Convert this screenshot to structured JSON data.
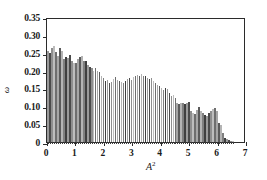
{
  "chart_data": {
    "type": "bar",
    "title": "",
    "subtitle": "",
    "xlabel": "A²",
    "xlabel_base": "A",
    "xlabel_exp": "2",
    "ylabel": "ω",
    "xlim": [
      0,
      7
    ],
    "ylim": [
      0,
      0.35
    ],
    "grid": false,
    "legend": null,
    "bin_width": 0.07,
    "x_ticks": [
      0,
      1,
      2,
      3,
      4,
      5,
      6,
      7
    ],
    "x_ticklabels": [
      "0",
      "1",
      "2",
      "3",
      "4",
      "5",
      "6",
      "7"
    ],
    "y_ticks": [
      0,
      0.05,
      0.1,
      0.15,
      0.2,
      0.25,
      0.3,
      0.35
    ],
    "y_ticklabels": [
      "0",
      "0.05",
      "0.10",
      "0.15",
      "0.20",
      "0.25",
      "0.30",
      "0.35"
    ],
    "x": [
      0.04,
      0.11,
      0.18,
      0.25,
      0.32,
      0.39,
      0.46,
      0.53,
      0.6,
      0.67,
      0.74,
      0.81,
      0.88,
      0.95,
      1.02,
      1.09,
      1.16,
      1.23,
      1.3,
      1.37,
      1.44,
      1.51,
      1.58,
      1.65,
      1.72,
      1.79,
      1.86,
      1.93,
      2.0,
      2.07,
      2.14,
      2.21,
      2.28,
      2.35,
      2.42,
      2.49,
      2.56,
      2.63,
      2.7,
      2.77,
      2.84,
      2.91,
      2.98,
      3.05,
      3.12,
      3.19,
      3.26,
      3.33,
      3.4,
      3.47,
      3.54,
      3.61,
      3.68,
      3.75,
      3.82,
      3.89,
      3.96,
      4.03,
      4.1,
      4.17,
      4.24,
      4.31,
      4.38,
      4.45,
      4.52,
      4.59,
      4.66,
      4.73,
      4.8,
      4.87,
      4.94,
      5.01,
      5.08,
      5.15,
      5.22,
      5.29,
      5.36,
      5.43,
      5.5,
      5.57,
      5.64,
      5.71,
      5.78,
      5.85,
      5.92,
      5.99,
      6.06,
      6.13,
      6.2,
      6.27,
      6.34,
      6.41,
      6.48,
      6.55
    ],
    "values": [
      0.255,
      0.248,
      0.262,
      0.268,
      0.252,
      0.24,
      0.262,
      0.256,
      0.232,
      0.238,
      0.236,
      0.244,
      0.226,
      0.222,
      0.22,
      0.232,
      0.238,
      0.242,
      0.228,
      0.226,
      0.216,
      0.21,
      0.208,
      0.198,
      0.206,
      0.2,
      0.196,
      0.186,
      0.178,
      0.17,
      0.174,
      0.166,
      0.168,
      0.176,
      0.182,
      0.174,
      0.172,
      0.168,
      0.164,
      0.17,
      0.176,
      0.18,
      0.174,
      0.182,
      0.186,
      0.188,
      0.184,
      0.19,
      0.186,
      0.184,
      0.18,
      0.176,
      0.178,
      0.172,
      0.166,
      0.16,
      0.158,
      0.15,
      0.146,
      0.152,
      0.148,
      0.138,
      0.128,
      0.132,
      0.124,
      0.108,
      0.106,
      0.11,
      0.108,
      0.106,
      0.11,
      0.112,
      0.086,
      0.08,
      0.078,
      0.09,
      0.098,
      0.086,
      0.08,
      0.076,
      0.072,
      0.08,
      0.088,
      0.092,
      0.094,
      0.086,
      0.052,
      0.048,
      0.024,
      0.012,
      0.008,
      0.006,
      0.004,
      0.003
    ],
    "bar_shades": [
      "#9a9a9a",
      "#4a4a4a",
      "#8e8e8e",
      "#bdbdbd",
      "#6e6e6e",
      "#a6a6a6",
      "#5a5a5a",
      "#b4b4b4",
      "#808080",
      "#3f3f3f"
    ],
    "colors": {
      "axis": "#2b2b2b",
      "text": "#1a1a1a",
      "background": "#ffffff",
      "bar_light": "#bdbdbd",
      "bar_mid": "#8e8e8e",
      "bar_dark": "#3f3f3f"
    }
  }
}
